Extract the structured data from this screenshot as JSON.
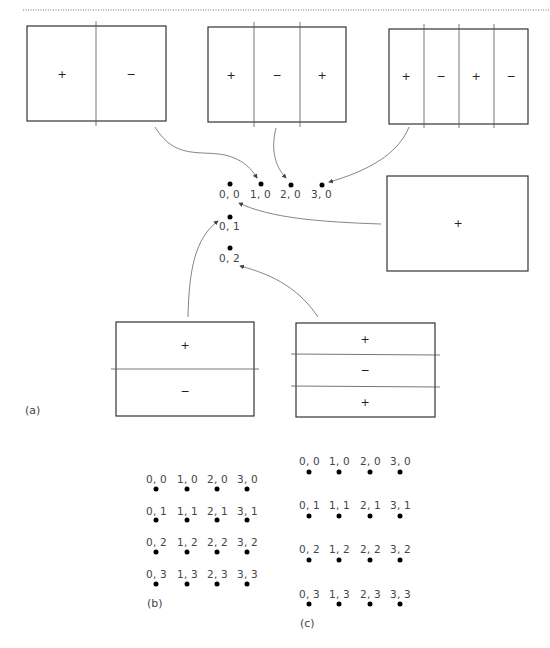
{
  "figure": {
    "top_rule": {
      "style": "dotted",
      "color": "#777777"
    },
    "panel_a": {
      "caption": "(a)",
      "vertical_modes": [
        {
          "id": "mode-1-0",
          "signs": [
            "+",
            "−"
          ],
          "target": "1, 0"
        },
        {
          "id": "mode-2-0",
          "signs": [
            "+",
            "−",
            "+"
          ],
          "target": "2, 0"
        },
        {
          "id": "mode-3-0",
          "signs": [
            "+",
            "−",
            "+",
            "−"
          ],
          "target": "3, 0"
        }
      ],
      "uniform_mode": {
        "id": "mode-0-0",
        "signs": [
          "+"
        ],
        "target": "0, 0"
      },
      "horizontal_modes": [
        {
          "id": "mode-0-1",
          "signs": [
            "+",
            "−"
          ],
          "target": "0, 1"
        },
        {
          "id": "mode-0-2",
          "signs": [
            "+",
            "−",
            "+"
          ],
          "target": "0, 2"
        }
      ],
      "points": [
        {
          "label": "0, 0"
        },
        {
          "label": "1, 0"
        },
        {
          "label": "2, 0"
        },
        {
          "label": "3, 0"
        },
        {
          "label": "0, 1"
        },
        {
          "label": "0, 2"
        }
      ]
    },
    "panel_b": {
      "caption": "(b)",
      "rows": [
        [
          "0, 0",
          "1, 0",
          "2, 0",
          "3, 0"
        ],
        [
          "0, 1",
          "1, 1",
          "2, 1",
          "3, 1"
        ],
        [
          "0, 2",
          "1, 2",
          "2, 2",
          "3, 2"
        ],
        [
          "0, 3",
          "1, 3",
          "2, 3",
          "3, 3"
        ]
      ]
    },
    "panel_c": {
      "caption": "(c)",
      "rows": [
        [
          "0, 0",
          "1, 0",
          "2, 0",
          "3, 0"
        ],
        [
          "0, 1",
          "1, 1",
          "2, 1",
          "3, 1"
        ],
        [
          "0, 2",
          "1, 2",
          "2, 2",
          "3, 2"
        ],
        [
          "0, 3",
          "1, 3",
          "2, 3",
          "3, 3"
        ]
      ]
    }
  }
}
